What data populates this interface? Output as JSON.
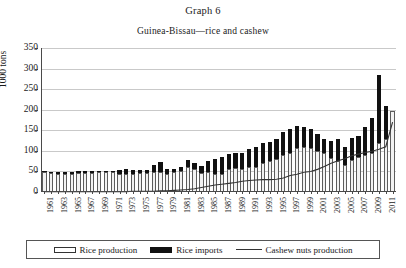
{
  "chart_data": {
    "type": "bar",
    "title": "Graph 6",
    "subtitle": "Guinea-Bissau—rice and cashew",
    "xlabel": "",
    "ylabel": "1000 tons",
    "ylim": [
      0,
      350
    ],
    "yticks": [
      0,
      50,
      100,
      150,
      200,
      250,
      300,
      350
    ],
    "grid": true,
    "legend_position": "bottom",
    "stacked": true,
    "x": [
      1961,
      1962,
      1963,
      1964,
      1965,
      1966,
      1967,
      1968,
      1969,
      1970,
      1971,
      1972,
      1973,
      1974,
      1975,
      1976,
      1977,
      1978,
      1979,
      1980,
      1981,
      1982,
      1983,
      1984,
      1985,
      1986,
      1987,
      1988,
      1989,
      1990,
      1991,
      1992,
      1993,
      1994,
      1995,
      1996,
      1997,
      1998,
      1999,
      2000,
      2001,
      2002,
      2003,
      2004,
      2005,
      2006,
      2007,
      2008,
      2009,
      2010,
      2011,
      2012
    ],
    "xtick_labels": [
      "1961",
      "1963",
      "1965",
      "1967",
      "1969",
      "1971",
      "1973",
      "1975",
      "1977",
      "1979",
      "1981",
      "1983",
      "1985",
      "1987",
      "1989",
      "1991",
      "1993",
      "1995",
      "1997",
      "1999",
      "2001",
      "2003",
      "2005",
      "2007",
      "2009",
      "2011"
    ],
    "series": [
      {
        "name": "Rice production",
        "style": "bar-hollow",
        "color": "#f2f2f2",
        "values": [
          48,
          46,
          45,
          45,
          45,
          46,
          47,
          47,
          48,
          49,
          48,
          44,
          43,
          45,
          46,
          46,
          48,
          48,
          43,
          49,
          52,
          62,
          55,
          47,
          48,
          45,
          43,
          55,
          58,
          57,
          60,
          62,
          70,
          75,
          80,
          90,
          95,
          107,
          110,
          107,
          100,
          95,
          83,
          75,
          65,
          78,
          84,
          90,
          95,
          120,
          130,
          196
        ]
      },
      {
        "name": "Rice imports",
        "style": "bar-solid",
        "color": "#111111",
        "values": [
          2,
          3,
          3,
          3,
          4,
          4,
          4,
          4,
          4,
          2,
          4,
          9,
          12,
          8,
          7,
          8,
          18,
          26,
          14,
          6,
          9,
          16,
          15,
          16,
          28,
          36,
          42,
          37,
          36,
          38,
          44,
          48,
          48,
          47,
          50,
          57,
          58,
          53,
          47,
          46,
          40,
          35,
          42,
          55,
          45,
          53,
          52,
          68,
          85,
          165,
          80,
          0
        ]
      },
      {
        "name": "Cashew nuts production",
        "style": "line",
        "color": "#333333",
        "values": [
          1,
          1,
          1,
          1,
          1,
          1,
          1,
          1,
          1,
          1,
          1,
          1,
          1,
          2,
          2,
          2,
          2,
          3,
          3,
          4,
          5,
          6,
          8,
          11,
          14,
          17,
          19,
          21,
          23,
          26,
          28,
          29,
          30,
          30,
          31,
          34,
          40,
          43,
          48,
          50,
          55,
          62,
          70,
          76,
          81,
          88,
          92,
          96,
          99,
          104,
          110,
          170
        ]
      }
    ]
  },
  "legend": {
    "items": [
      {
        "label": "Rice production",
        "swatch": "bar-hollow-swatch"
      },
      {
        "label": "Rice imports",
        "swatch": "bar-solid-swatch"
      },
      {
        "label": "Cashew nuts production",
        "swatch": "line-swatch"
      }
    ]
  }
}
